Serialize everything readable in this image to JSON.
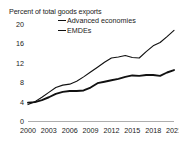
{
  "chart_data": {
    "type": "line",
    "title": "Percent of total goods exports",
    "xlabel": "",
    "ylabel": "",
    "ylim": [
      0,
      20
    ],
    "yticks": [
      "0",
      "4",
      "8",
      "12",
      "16",
      "20"
    ],
    "ytick_values": [
      0,
      4,
      8,
      12,
      16,
      20
    ],
    "xticks": [
      "2000",
      "2003",
      "2006",
      "2009",
      "2012",
      "2015",
      "2018",
      "2021"
    ],
    "xtick_values": [
      2000,
      2003,
      2006,
      2009,
      2012,
      2015,
      2018,
      2021
    ],
    "xlim": [
      2000,
      2021
    ],
    "grid": false,
    "legend_position": "top-center",
    "x": [
      2000,
      2001,
      2002,
      2003,
      2004,
      2005,
      2006,
      2007,
      2008,
      2009,
      2010,
      2011,
      2012,
      2013,
      2014,
      2015,
      2016,
      2017,
      2018,
      2019,
      2020,
      2021
    ],
    "series": [
      {
        "name": "Advanced economies",
        "color": "#111111",
        "values": [
          3.9,
          4.0,
          4.4,
          5.0,
          5.7,
          6.1,
          6.3,
          6.3,
          6.4,
          7.0,
          7.9,
          8.2,
          8.5,
          8.8,
          9.2,
          9.5,
          9.4,
          9.6,
          9.6,
          9.4,
          10.1,
          10.6
        ]
      },
      {
        "name": "EMDEs",
        "color": "#111111",
        "values": [
          3.5,
          4.1,
          5.0,
          6.0,
          7.0,
          7.5,
          7.7,
          8.3,
          9.2,
          10.2,
          11.2,
          12.2,
          13.1,
          13.3,
          13.6,
          13.2,
          13.1,
          14.4,
          15.6,
          16.3,
          17.5,
          18.8
        ]
      }
    ],
    "legend": [
      "Advanced economies",
      "EMDEs"
    ]
  }
}
